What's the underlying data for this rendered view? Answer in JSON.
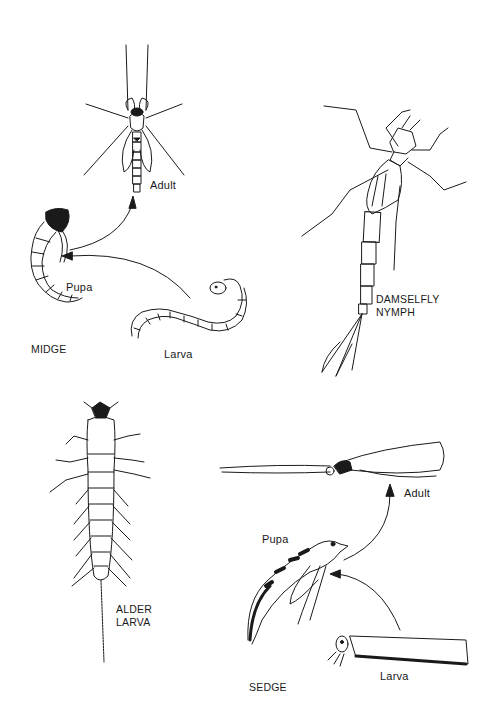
{
  "labels": {
    "midge_adult": "Adult",
    "midge_pupa": "Pupa",
    "midge_larva": "Larva",
    "midge_title": "MIDGE",
    "damselfly_line1": "DAMSELFLY",
    "damselfly_line2": "NYMPH",
    "alder_line1": "ALDER",
    "alder_line2": "LARVA",
    "sedge_adult": "Adult",
    "sedge_pupa": "Pupa",
    "sedge_larva": "Larva",
    "sedge_title": "SEDGE"
  },
  "groups": [
    {
      "name": "MIDGE",
      "stages": [
        "Larva",
        "Pupa",
        "Adult"
      ]
    },
    {
      "name": "DAMSELFLY NYMPH",
      "stages": []
    },
    {
      "name": "ALDER LARVA",
      "stages": []
    },
    {
      "name": "SEDGE",
      "stages": [
        "Larva",
        "Pupa",
        "Adult"
      ]
    }
  ],
  "colors": {
    "ink": "#1a1a1a",
    "background": "#ffffff"
  }
}
